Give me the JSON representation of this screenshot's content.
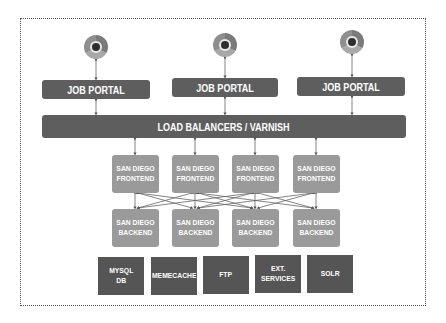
{
  "diagram": {
    "title": "",
    "clients": [
      {
        "icon": "browser-icon"
      },
      {
        "icon": "browser-icon"
      },
      {
        "icon": "browser-icon"
      }
    ],
    "portals": [
      {
        "label": "JOB PORTAL"
      },
      {
        "label": "JOB PORTAL"
      },
      {
        "label": "JOB PORTAL"
      }
    ],
    "load_balancer": {
      "label": "LOAD BALANCERS / VARNISH"
    },
    "frontends": [
      {
        "label": "SAN DIEGO\nFRONTEND"
      },
      {
        "label": "SAN DIEGO\nFRONTEND"
      },
      {
        "label": "SAN DIEGO\nFRONTEND"
      },
      {
        "label": "SAN DIEGO\nFRONTEND"
      }
    ],
    "backends": [
      {
        "label": "SAN DIEGO\nBACKEND"
      },
      {
        "label": "SAN DIEGO\nBACKEND"
      },
      {
        "label": "SAN DIEGO\nBACKEND"
      },
      {
        "label": "SAN DIEGO\nBACKEND"
      }
    ],
    "services": [
      {
        "label": "MYSQL\nDB"
      },
      {
        "label": "MEMECACHE"
      },
      {
        "label": "FTP"
      },
      {
        "label": "EXT.\nSERVICES"
      },
      {
        "label": "SOLR"
      }
    ],
    "colors": {
      "portal_bar": "#5e5e5e",
      "node_box": "#9a9a9a",
      "service_box": "#555555",
      "text": "#ffffff",
      "connector": "#555555"
    }
  }
}
